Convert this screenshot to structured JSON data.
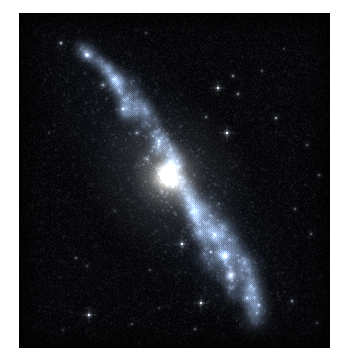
{
  "image": {
    "kind": "astronomical-photograph",
    "subject": "spiral galaxy",
    "alt_text": "Ultraviolet image of an inclined spiral galaxy with a bright compact nucleus and knotty spiral arms on a starfield",
    "band_hint": "near-ultraviolet / blue",
    "background_color": "#ffffff",
    "sky_color": "#040406",
    "core_color": "#fffdf4",
    "arm_color": "#bcd4f2",
    "star_color": "#ffffff"
  },
  "frame": {
    "x": 19,
    "y": 13,
    "width": 311,
    "height": 335
  },
  "galaxy": {
    "nucleus": {
      "x": 149,
      "y": 164,
      "radius": 26,
      "peak_brightness": 1.0
    },
    "disk": {
      "center_x": 149,
      "center_y": 164,
      "position_angle_deg": 53,
      "major_axis": 420,
      "minor_axis": 132,
      "inclination_hint": "highly inclined"
    },
    "arm_segments": [
      {
        "name": "ne-outer-arm",
        "x0": 96,
        "y0": 62,
        "x1": 196,
        "y1": 262,
        "width": 9,
        "brightness": 0.62
      },
      {
        "name": "ne-inner-arm",
        "x0": 112,
        "y0": 70,
        "x1": 190,
        "y1": 250,
        "width": 7,
        "brightness": 0.5
      },
      {
        "name": "sw-outer-arm",
        "x0": 182,
        "y0": 190,
        "x1": 240,
        "y1": 310,
        "width": 10,
        "brightness": 0.55
      },
      {
        "name": "sw-inner-arm",
        "x0": 170,
        "y0": 190,
        "x1": 214,
        "y1": 286,
        "width": 7,
        "brightness": 0.45
      },
      {
        "name": "ne-far-tip",
        "x0": 60,
        "y0": 34,
        "x1": 110,
        "y1": 104,
        "width": 7,
        "brightness": 0.48
      }
    ],
    "bright_knots": [
      {
        "name": "ne-tip-knot",
        "x": 68,
        "y": 42,
        "r": 7,
        "b": 0.7
      },
      {
        "name": "ne-arm-knot-1",
        "x": 84,
        "y": 72,
        "r": 5,
        "b": 0.55
      },
      {
        "name": "ne-arm-knot-2",
        "x": 104,
        "y": 96,
        "r": 5,
        "b": 0.6
      },
      {
        "name": "ne-arm-knot-3",
        "x": 118,
        "y": 120,
        "r": 4,
        "b": 0.52
      },
      {
        "name": "ne-arm-knot-4",
        "x": 128,
        "y": 146,
        "r": 4,
        "b": 0.5
      },
      {
        "name": "inner-ring-knot",
        "x": 140,
        "y": 128,
        "r": 5,
        "b": 0.48
      },
      {
        "name": "sw-star-cloud",
        "x": 212,
        "y": 262,
        "r": 15,
        "b": 0.58
      },
      {
        "name": "sw-bright-knot",
        "x": 206,
        "y": 243,
        "r": 6,
        "b": 0.85
      },
      {
        "name": "sw-arm-knot-1",
        "x": 196,
        "y": 222,
        "r": 4,
        "b": 0.5
      },
      {
        "name": "sw-arm-knot-2",
        "x": 228,
        "y": 285,
        "r": 5,
        "b": 0.45
      },
      {
        "name": "sw-outer-knot",
        "x": 238,
        "y": 300,
        "r": 4,
        "b": 0.4
      }
    ]
  },
  "foreground_stars": [
    {
      "x": 42,
      "y": 30,
      "r": 1.8,
      "b": 0.95
    },
    {
      "x": 127,
      "y": 20,
      "r": 1.2,
      "b": 0.7
    },
    {
      "x": 214,
      "y": 63,
      "r": 1.5,
      "b": 0.85
    },
    {
      "x": 243,
      "y": 58,
      "r": 1.2,
      "b": 0.7
    },
    {
      "x": 199,
      "y": 75,
      "r": 2.2,
      "b": 1.0
    },
    {
      "x": 219,
      "y": 81,
      "r": 1.6,
      "b": 0.8
    },
    {
      "x": 187,
      "y": 104,
      "r": 1.4,
      "b": 0.75
    },
    {
      "x": 208,
      "y": 120,
      "r": 2.4,
      "b": 1.0
    },
    {
      "x": 257,
      "y": 105,
      "r": 1.7,
      "b": 0.85
    },
    {
      "x": 288,
      "y": 132,
      "r": 1.3,
      "b": 0.7
    },
    {
      "x": 300,
      "y": 162,
      "r": 1.5,
      "b": 0.78
    },
    {
      "x": 276,
      "y": 196,
      "r": 1.3,
      "b": 0.7
    },
    {
      "x": 292,
      "y": 221,
      "r": 1.4,
      "b": 0.72
    },
    {
      "x": 163,
      "y": 231,
      "r": 2.3,
      "b": 1.0
    },
    {
      "x": 192,
      "y": 239,
      "r": 1.6,
      "b": 0.82
    },
    {
      "x": 131,
      "y": 257,
      "r": 1.2,
      "b": 0.68
    },
    {
      "x": 57,
      "y": 245,
      "r": 1.3,
      "b": 0.7
    },
    {
      "x": 68,
      "y": 253,
      "r": 1.2,
      "b": 0.66
    },
    {
      "x": 182,
      "y": 290,
      "r": 2.2,
      "b": 1.0
    },
    {
      "x": 240,
      "y": 292,
      "r": 1.5,
      "b": 0.78
    },
    {
      "x": 273,
      "y": 288,
      "r": 1.6,
      "b": 0.8
    },
    {
      "x": 70,
      "y": 302,
      "r": 2.3,
      "b": 1.0
    },
    {
      "x": 113,
      "y": 311,
      "r": 1.2,
      "b": 0.65
    },
    {
      "x": 176,
      "y": 316,
      "r": 1.3,
      "b": 0.7
    },
    {
      "x": 44,
      "y": 317,
      "r": 1.1,
      "b": 0.6
    },
    {
      "x": 298,
      "y": 310,
      "r": 1.2,
      "b": 0.66
    },
    {
      "x": 140,
      "y": 295,
      "r": 1.1,
      "b": 0.6
    },
    {
      "x": 96,
      "y": 198,
      "r": 1.1,
      "b": 0.58
    },
    {
      "x": 30,
      "y": 120,
      "r": 1.0,
      "b": 0.55
    },
    {
      "x": 265,
      "y": 36,
      "r": 1.1,
      "b": 0.6
    }
  ],
  "render": {
    "star_field_count": 2600,
    "noise_amplitude": 18,
    "seed": 20240917
  }
}
